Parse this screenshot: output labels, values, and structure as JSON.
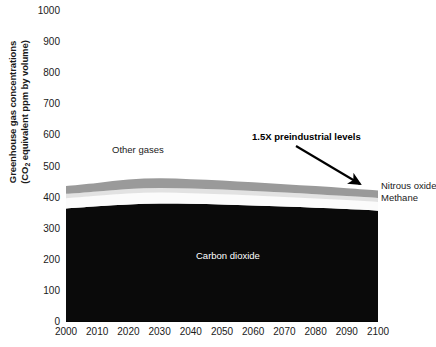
{
  "chart_data": {
    "type": "area",
    "title": "",
    "subtitle": "",
    "xlabel": "",
    "ylabel": "Greenhouse gas concentrations (CO2 equivalent ppm by volume)",
    "ylabel_line1": "Greenhouse gas concentrations",
    "ylabel_line2_pre": "(CO",
    "ylabel_line2_sub": "2",
    "ylabel_line2_post": " equivalent ppm by volume)",
    "stacked": true,
    "grid": false,
    "legend_position": "inline-annotations",
    "xlim": [
      2000,
      2100
    ],
    "ylim": [
      0,
      1000
    ],
    "xticks": [
      2000,
      2010,
      2020,
      2030,
      2040,
      2050,
      2060,
      2070,
      2080,
      2090,
      2100
    ],
    "yticks": [
      0,
      100,
      200,
      300,
      400,
      500,
      600,
      700,
      800,
      900,
      1000
    ],
    "x": [
      2000,
      2010,
      2020,
      2030,
      2040,
      2050,
      2060,
      2070,
      2080,
      2090,
      2100
    ],
    "series": [
      {
        "name": "Carbon dioxide",
        "color": "#0a0a0a",
        "values": [
          365,
          372,
          378,
          381,
          380,
          378,
          375,
          371,
          367,
          363,
          358
        ]
      },
      {
        "name": "Methane",
        "color": "#fbfbfb",
        "values": [
          33,
          34,
          35,
          35,
          34,
          33,
          32,
          31,
          30,
          29,
          28
        ]
      },
      {
        "name": "Nitrous oxide",
        "color": "#e2e2e2",
        "values": [
          14,
          14,
          15,
          15,
          15,
          15,
          14,
          14,
          14,
          13,
          13
        ]
      },
      {
        "name": "Other gases",
        "color": "#9a9a9a",
        "values": [
          25,
          27,
          30,
          31,
          30,
          29,
          28,
          27,
          26,
          25,
          24
        ]
      }
    ],
    "cumulative_top": [
      437,
      447,
      458,
      462,
      459,
      455,
      449,
      443,
      437,
      430,
      423
    ],
    "annotations": [
      {
        "name": "other-gases",
        "text": "Other gases"
      },
      {
        "name": "preindustrial",
        "text": "1.5X preindustrial levels"
      },
      {
        "name": "nitrous-oxide",
        "text": "Nitrous oxide"
      },
      {
        "name": "methane",
        "text": "Methane"
      },
      {
        "name": "carbon-dioxide",
        "text": "Carbon dioxide"
      }
    ]
  },
  "axes": {
    "y_tick_labels": [
      "1000",
      "900",
      "800",
      "700",
      "600",
      "500",
      "400",
      "300",
      "200",
      "100",
      "0"
    ],
    "x_tick_labels": [
      "2000",
      "2010",
      "2020",
      "2030",
      "2040",
      "2050",
      "2060",
      "2070",
      "2080",
      "2090",
      "2100"
    ]
  },
  "labels": {
    "other_gases": "Other gases",
    "preindustrial": "1.5X preindustrial levels",
    "nitrous_oxide": "Nitrous oxide",
    "methane": "Methane",
    "carbon_dioxide": "Carbon dioxide",
    "y_title_line1": "Greenhouse gas concentrations",
    "y_title_line2_pre": "(CO",
    "y_title_line2_sub": "2",
    "y_title_line2_post": " equivalent ppm by volume)"
  }
}
